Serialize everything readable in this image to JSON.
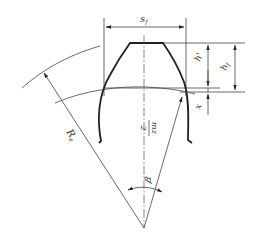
{
  "diagram": {
    "type": "gear-tooth-geometry",
    "colors": {
      "line": "#222222",
      "thin_line": "#444444",
      "background": "#ffffff"
    },
    "labels": {
      "tooth_thickness": "s",
      "tooth_thickness_sub": "f",
      "addendum": "h'",
      "tooth_height": "h",
      "tooth_height_sub": "f",
      "shift": "x",
      "radius": "R",
      "radius_sub": "e",
      "pitch_radius_num": "mz",
      "pitch_radius_den": "2",
      "angle": "β"
    }
  }
}
